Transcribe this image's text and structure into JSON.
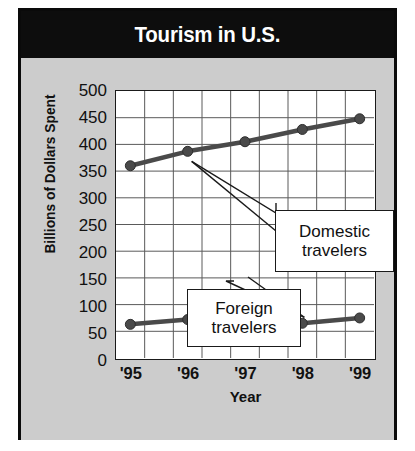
{
  "title": "Tourism in U.S.",
  "chart_data": {
    "type": "line",
    "title": "Tourism in U.S.",
    "xlabel": "Year",
    "ylabel": "Billions of Dollars Spent",
    "categories": [
      "'95",
      "'96",
      "'97",
      "'98",
      "'99"
    ],
    "ylim": [
      0,
      500
    ],
    "ytick_labels": [
      "500",
      "450",
      "400",
      "350",
      "300",
      "250",
      "200",
      "150",
      "100",
      "50",
      "0"
    ],
    "ytick_values": [
      500,
      450,
      400,
      350,
      300,
      250,
      200,
      150,
      100,
      50,
      0
    ],
    "grid": true,
    "legend_position": "inline-callouts",
    "series": [
      {
        "name": "Domestic travelers",
        "values": [
          360,
          387,
          405,
          428,
          448
        ]
      },
      {
        "name": "Foreign travelers",
        "values": [
          63,
          72,
          70,
          65,
          75
        ]
      }
    ],
    "annotations": [
      {
        "label_line1": "Domestic",
        "label_line2": "travelers"
      },
      {
        "label_line1": "Foreign",
        "label_line2": "travelers"
      }
    ]
  },
  "colors": {
    "title_bar": "#0d0d0d",
    "title_text": "#ffffff",
    "panel": "#cccccc",
    "plot_bg": "#ffffff",
    "grid": "#5a5a5a",
    "line": "#4a4a4a",
    "border": "#0a0a0a"
  }
}
